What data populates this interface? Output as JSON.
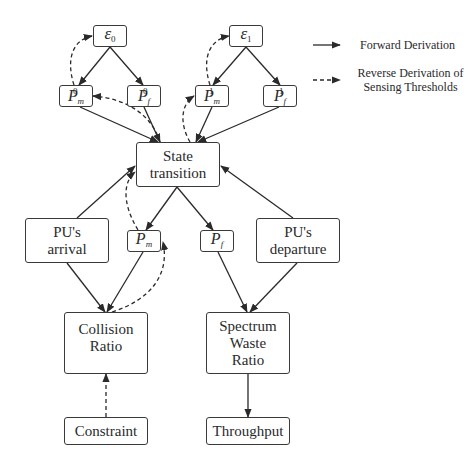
{
  "diagram": {
    "nodes": {
      "eps0": {
        "symbol": "ε",
        "sub": "0"
      },
      "eps1": {
        "symbol": "ε",
        "sub": "1"
      },
      "pm0": {
        "symbol": "P",
        "sup": "0",
        "sub": "m"
      },
      "pf0": {
        "symbol": "P",
        "sup": "0",
        "sub": "f"
      },
      "pm1": {
        "symbol": "P",
        "sup": "1",
        "sub": "m"
      },
      "pf1": {
        "symbol": "P",
        "sup": "1",
        "sub": "f"
      },
      "state": {
        "line1": "State",
        "line2": "transition"
      },
      "arrival": {
        "line1": "PU's",
        "line2": "arrival"
      },
      "pm": {
        "symbol": "P",
        "sub": "m"
      },
      "pf": {
        "symbol": "P",
        "sub": "f"
      },
      "departure": {
        "line1": "PU's",
        "line2": "departure"
      },
      "collision": {
        "line1": "Collision",
        "line2": "Ratio"
      },
      "waste": {
        "line1": "Spectrum",
        "line2": "Waste",
        "line3": "Ratio"
      },
      "constraint": {
        "label": "Constraint"
      },
      "throughput": {
        "label": "Throughput"
      }
    },
    "edges": [
      {
        "from": "eps0",
        "to": "pm0",
        "type": "forward"
      },
      {
        "from": "eps0",
        "to": "pf0",
        "type": "forward"
      },
      {
        "from": "eps1",
        "to": "pm1",
        "type": "forward"
      },
      {
        "from": "eps1",
        "to": "pf1",
        "type": "forward"
      },
      {
        "from": "pm0",
        "to": "state",
        "type": "forward"
      },
      {
        "from": "pf0",
        "to": "state",
        "type": "forward"
      },
      {
        "from": "pm1",
        "to": "state",
        "type": "forward"
      },
      {
        "from": "pf1",
        "to": "state",
        "type": "forward"
      },
      {
        "from": "arrival",
        "to": "state",
        "type": "forward"
      },
      {
        "from": "departure",
        "to": "state",
        "type": "forward"
      },
      {
        "from": "state",
        "to": "pm",
        "type": "forward"
      },
      {
        "from": "state",
        "to": "pf",
        "type": "forward"
      },
      {
        "from": "arrival",
        "to": "collision",
        "type": "forward"
      },
      {
        "from": "pm",
        "to": "collision",
        "type": "forward"
      },
      {
        "from": "pf",
        "to": "waste",
        "type": "forward"
      },
      {
        "from": "departure",
        "to": "waste",
        "type": "forward"
      },
      {
        "from": "waste",
        "to": "throughput",
        "type": "forward"
      },
      {
        "from": "constraint",
        "to": "collision",
        "type": "reverse"
      },
      {
        "from": "collision",
        "to": "pm",
        "type": "reverse"
      },
      {
        "from": "pm",
        "to": "state",
        "type": "reverse"
      },
      {
        "from": "state",
        "to": "pm0",
        "type": "reverse"
      },
      {
        "from": "state",
        "to": "pm1",
        "type": "reverse"
      },
      {
        "from": "pm0",
        "to": "eps0",
        "type": "reverse"
      },
      {
        "from": "pm1",
        "to": "eps1",
        "type": "reverse"
      }
    ]
  },
  "legend": {
    "forward": "Forward Derivation",
    "reverse_line1": "Reverse Derivation of",
    "reverse_line2": "Sensing Thresholds"
  },
  "colors": {
    "line": "#2a2a2a",
    "border": "#3a3a3a",
    "background": "#ffffff"
  }
}
